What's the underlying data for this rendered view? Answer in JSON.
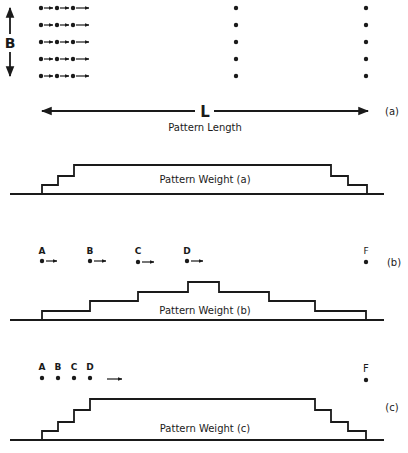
{
  "figure": {
    "panel_a": {
      "width_label": "B",
      "length_label": "L",
      "length_caption": "Pattern Length",
      "tag": "(a)",
      "weight_label": "Pattern Weight (a)",
      "rows": 5,
      "moving_dots_per_row": 3
    },
    "panel_b": {
      "point_labels": [
        "A",
        "B",
        "C",
        "D",
        "F"
      ],
      "tag": "(b)",
      "weight_label": "Pattern Weight (b)"
    },
    "panel_c": {
      "point_labels": [
        "A",
        "B",
        "C",
        "D",
        "F"
      ],
      "tag": "(c)",
      "weight_label": "Pattern Weight (c)"
    }
  }
}
